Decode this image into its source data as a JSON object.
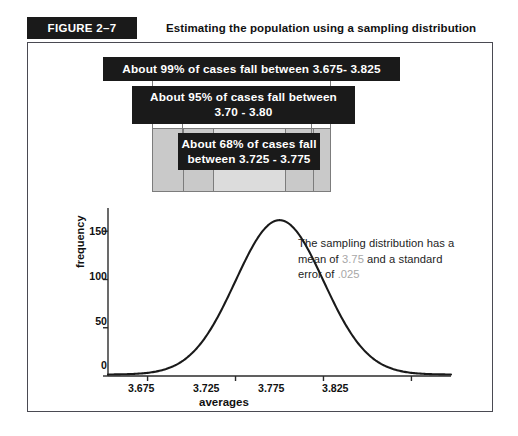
{
  "figure": {
    "tag": "FIGURE 2–7",
    "caption": "Estimating the population using a sampling distribution"
  },
  "callouts": [
    {
      "id": "callout-99",
      "line1": "About 99% of cases fall between 3.675- 3.825",
      "line2": ""
    },
    {
      "id": "callout-95",
      "line1": "About 95% of cases fall between",
      "line2": "3.70 - 3.80"
    },
    {
      "id": "callout-68",
      "line1": "About 68% of cases fall",
      "line2": "between 3.725 - 3.775"
    }
  ],
  "annotation": {
    "part1": "The sampling distribution has a mean of ",
    "mean": "3.75",
    "part2": " and a standard error of ",
    "se": ".025"
  },
  "chart_data": {
    "type": "line",
    "title": "Estimating the population using a sampling distribution",
    "xlabel": "averages",
    "ylabel": "frequency",
    "xlim": [
      3.6525,
      3.8475
    ],
    "ylim": [
      0,
      172
    ],
    "xticks": [
      "3.675",
      "3.725",
      "3.775",
      "3.825"
    ],
    "xtick_values": [
      3.675,
      3.725,
      3.775,
      3.825
    ],
    "yticks": [
      "0",
      "50",
      "100",
      "150"
    ],
    "ytick_values": [
      0,
      50,
      100,
      150
    ],
    "grid": false,
    "legend": null,
    "distribution": {
      "mean": 3.75,
      "standard_error": 0.025,
      "peak_frequency": 160,
      "peak_x": 3.7525
    },
    "x": [
      3.66,
      3.67,
      3.68,
      3.69,
      3.7,
      3.71,
      3.72,
      3.725,
      3.73,
      3.74,
      3.75,
      3.7525,
      3.76,
      3.77,
      3.775,
      3.78,
      3.79,
      3.8,
      3.81,
      3.82,
      3.83
    ],
    "y": [
      1,
      2,
      3,
      6,
      12,
      24,
      48,
      64,
      82,
      125,
      157,
      160,
      152,
      124,
      104,
      84,
      47,
      22,
      9,
      4,
      2
    ],
    "annotations": [
      "About 99% of cases fall between 3.675- 3.825",
      "About 95% of cases fall between 3.70 - 3.80",
      "About 68% of cases fall between 3.725 - 3.775"
    ]
  }
}
